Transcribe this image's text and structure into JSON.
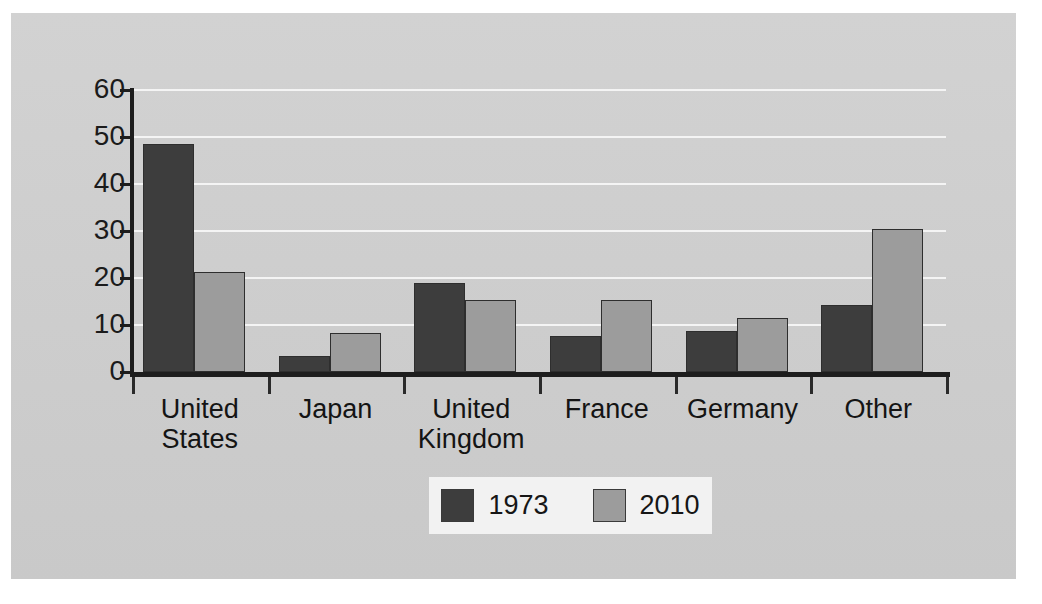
{
  "chart_data": {
    "type": "bar",
    "title": "",
    "subtitle": "",
    "xlabel": "",
    "ylabel": "",
    "categories": [
      "United States",
      "Japan",
      "United Kingdom",
      "France",
      "Germany",
      "Other"
    ],
    "category_lines": [
      [
        "United",
        "States"
      ],
      [
        "Japan"
      ],
      [
        "United",
        "Kingdom"
      ],
      [
        "France"
      ],
      [
        "Germany"
      ],
      [
        "Other"
      ]
    ],
    "series": [
      {
        "name": "1973",
        "color": "#3d3d3d",
        "values": [
          48.5,
          3.5,
          19.0,
          7.7,
          8.7,
          14.3
        ]
      },
      {
        "name": "2010",
        "color": "#9c9c9c",
        "values": [
          21.2,
          8.2,
          15.3,
          15.3,
          11.5,
          30.5
        ]
      }
    ],
    "ylim": [
      0,
      60
    ],
    "yticks": [
      0,
      10,
      20,
      30,
      40,
      50,
      60
    ],
    "ytick_labels": [
      "0",
      "10",
      "20",
      "30",
      "40",
      "50",
      "60"
    ],
    "grid": true,
    "grid_axis": "y",
    "legend": {
      "position": "bottom-center",
      "entries": [
        {
          "label": "1973",
          "color": "#3d3d3d"
        },
        {
          "label": "2010",
          "color": "#9c9c9c"
        }
      ]
    },
    "background_color": "#cfcfcf",
    "gridline_color": "#f4f4f4",
    "axis_color": "#1d1d1d"
  }
}
